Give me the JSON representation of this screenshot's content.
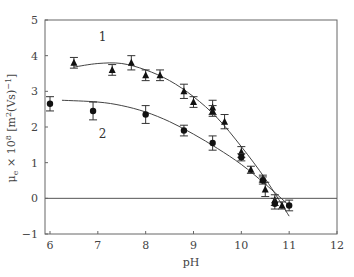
{
  "chart_data": {
    "type": "scatter",
    "title": "",
    "xlabel": "pH",
    "ylabel": "μe × 10⁸ [m²(Vs)⁻¹]",
    "ylabel_parts": {
      "main": "μ",
      "sub": "e",
      "rest": " × 10",
      "sup1": "8",
      "rest2": " [m",
      "sup2": "2",
      "rest3": "(Vs)",
      "sup3": "−1",
      "rest4": "]"
    },
    "xlim": [
      6,
      12
    ],
    "ylim": [
      -1,
      5
    ],
    "xticks": [
      6,
      7,
      8,
      9,
      10,
      11,
      12
    ],
    "yticks": [
      -1,
      0,
      1,
      2,
      3,
      4,
      5
    ],
    "grid": false,
    "reference_line": {
      "y": 0
    },
    "series": [
      {
        "name": "1",
        "marker": "triangle",
        "label_position": {
          "x": 7.1,
          "y": 4.4
        },
        "x": [
          6.5,
          7.3,
          7.7,
          8.0,
          8.3,
          8.8,
          9.0,
          9.4,
          9.4,
          9.65,
          10.0,
          10.2,
          10.45,
          10.5,
          10.7,
          10.85
        ],
        "y": [
          3.8,
          3.6,
          3.8,
          3.45,
          3.45,
          3.0,
          2.7,
          2.55,
          2.45,
          2.15,
          1.3,
          0.8,
          0.55,
          0.25,
          -0.05,
          -0.2
        ],
        "err": [
          0.15,
          0.15,
          0.2,
          0.15,
          0.15,
          0.2,
          0.15,
          0.2,
          0.15,
          0.2,
          0.15,
          0.1,
          0.1,
          0.2,
          0.15,
          0.1
        ],
        "fit_x": [
          6.5,
          7.0,
          7.5,
          8.0,
          8.5,
          9.0,
          9.5,
          10.0,
          10.5,
          11.0
        ],
        "fit_y": [
          3.68,
          3.78,
          3.78,
          3.6,
          3.3,
          2.85,
          2.25,
          1.45,
          0.55,
          -0.5
        ]
      },
      {
        "name": "2",
        "marker": "circle",
        "label_position": {
          "x": 7.1,
          "y": 1.7
        },
        "x": [
          6.0,
          6.9,
          8.0,
          8.8,
          9.4,
          10.0,
          10.45,
          10.7,
          11.0
        ],
        "y": [
          2.65,
          2.45,
          2.35,
          1.9,
          1.55,
          1.15,
          0.5,
          -0.15,
          -0.2
        ],
        "err": [
          0.2,
          0.25,
          0.25,
          0.15,
          0.2,
          0.1,
          0.1,
          0.15,
          0.15
        ],
        "fit_x": [
          6.25,
          7.0,
          7.5,
          8.0,
          8.5,
          9.0,
          9.5,
          10.0,
          10.5,
          11.0
        ],
        "fit_y": [
          2.75,
          2.7,
          2.6,
          2.42,
          2.15,
          1.8,
          1.4,
          0.95,
          0.4,
          -0.2
        ]
      }
    ]
  }
}
